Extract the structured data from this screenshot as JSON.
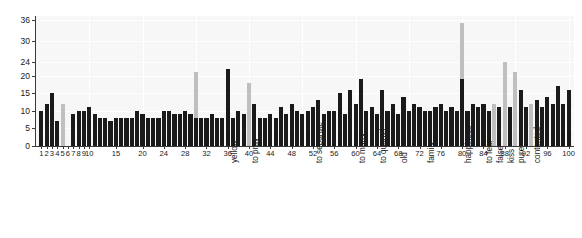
{
  "chart_data": {
    "type": "bar",
    "title": "",
    "subtitle": "",
    "xlabel": "",
    "ylabel": "",
    "xlim": [
      0,
      101
    ],
    "ylim": [
      0,
      37
    ],
    "grid": true,
    "legend_position": "none",
    "y_ticks": [
      0,
      5,
      10,
      15,
      20,
      24,
      30,
      36
    ],
    "x_ticks": [
      1,
      2,
      3,
      4,
      5,
      6,
      7,
      8,
      9,
      10,
      15,
      20,
      24,
      28,
      32,
      36,
      40,
      44,
      48,
      52,
      56,
      60,
      64,
      68,
      72,
      76,
      80,
      84,
      88,
      92,
      96,
      100
    ],
    "colors": {
      "dark_bar": "#1a1a1a",
      "light_bar": "#bfbfbf",
      "plot_background": "#f7f7f7",
      "grid_line": "#ffffff",
      "axis": "#3a3a3a",
      "text": "#1a1a1a"
    },
    "series": [
      {
        "name": "dark",
        "values": [
          10,
          12,
          15,
          7,
          0,
          0,
          9,
          10,
          10,
          11,
          9,
          8,
          8,
          7,
          8,
          8,
          8,
          8,
          10,
          9,
          8,
          8,
          8,
          10,
          10,
          9,
          9,
          10,
          9,
          8,
          8,
          8,
          9,
          8,
          8,
          22,
          8,
          10,
          9,
          0,
          12,
          8,
          8,
          9,
          8,
          11,
          9,
          12,
          10,
          9,
          10,
          11,
          13,
          9,
          10,
          10,
          15,
          9,
          16,
          12,
          19,
          10,
          11,
          9,
          16,
          10,
          12,
          9,
          14,
          10,
          12,
          11,
          10,
          10,
          11,
          12,
          10,
          11,
          10,
          19,
          10,
          12,
          11,
          12,
          10,
          0,
          11,
          0,
          11,
          0,
          16,
          11,
          0,
          13,
          11,
          14,
          12,
          17,
          12,
          16
        ]
      },
      {
        "name": "light",
        "values": [
          0,
          0,
          0,
          0,
          12,
          0,
          0,
          0,
          0,
          0,
          0,
          0,
          0,
          0,
          0,
          0,
          0,
          0,
          0,
          0,
          0,
          0,
          0,
          0,
          0,
          0,
          0,
          0,
          0,
          21,
          0,
          0,
          0,
          0,
          0,
          0,
          0,
          0,
          0,
          18,
          0,
          0,
          0,
          0,
          0,
          0,
          0,
          0,
          0,
          0,
          0,
          0,
          0,
          0,
          0,
          0,
          0,
          0,
          0,
          0,
          0,
          0,
          0,
          0,
          0,
          0,
          0,
          0,
          0,
          0,
          0,
          0,
          0,
          0,
          0,
          0,
          0,
          0,
          0,
          35,
          0,
          0,
          0,
          0,
          0,
          12,
          0,
          24,
          0,
          21,
          0,
          0,
          12,
          0,
          0,
          0,
          0,
          0,
          0,
          0
        ]
      }
    ],
    "word_labels": [
      {
        "x": 36,
        "text": "yellow"
      },
      {
        "x": 40,
        "text": "to pray"
      },
      {
        "x": 52,
        "text": "to separate"
      },
      {
        "x": 60,
        "text": "to marry"
      },
      {
        "x": 64,
        "text": "to quarrel"
      },
      {
        "x": 68,
        "text": "old"
      },
      {
        "x": 73,
        "text": "family"
      },
      {
        "x": 80,
        "text": "happiness"
      },
      {
        "x": 84,
        "text": "to fear"
      },
      {
        "x": 86,
        "text": "false"
      },
      {
        "x": 88,
        "text": "kiss"
      },
      {
        "x": 90,
        "text": "pure"
      },
      {
        "x": 93,
        "text": "contented"
      }
    ]
  }
}
